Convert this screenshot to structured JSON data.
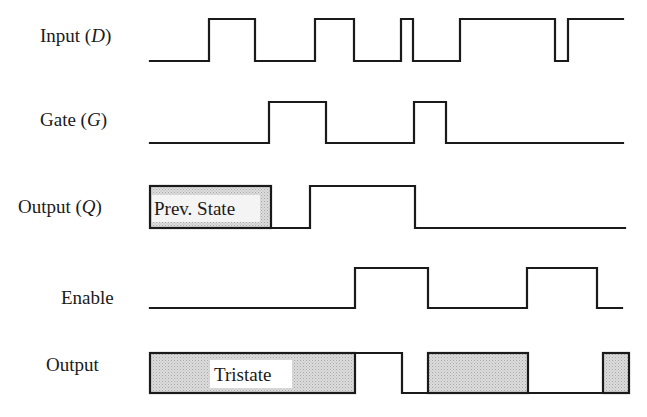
{
  "diagram": {
    "type": "timing-diagram",
    "signals": [
      {
        "id": "input_d",
        "label": "Input (",
        "label_var": "D",
        "label_end": ")",
        "y_high": 19,
        "y_low": 61,
        "points": "150,61 209,61 209,19 255,19 255,61 315,61 315,19 354,19 354,61 401,61 401,19 413,19 413,61 460,61 460,19 555,19 555,61 568,61 568,19 623,19"
      },
      {
        "id": "gate_g",
        "label": "Gate (",
        "label_var": "G",
        "label_end": ")",
        "y_high": 102,
        "y_low": 143,
        "points": "150,143 269,143 269,102 326,102 326,143 414,143 414,102 446,102 446,143 623,143"
      },
      {
        "id": "output_q",
        "label": "Output (",
        "label_var": "Q",
        "label_end": ")",
        "y_high": 186,
        "y_low": 228,
        "box": {
          "x": 150,
          "y": 186,
          "w": 121,
          "h": 42,
          "text": "Prev. State"
        },
        "points": "271,228 310,228 310,186 415,186 415,228 625,228"
      },
      {
        "id": "enable",
        "label": "Enable",
        "y_high": 268,
        "y_low": 308,
        "points": "150,308 355,308 355,268 428,268 428,308 527,308 527,268 597,268 597,308 622,308"
      },
      {
        "id": "output",
        "label": "Output",
        "y_high": 353,
        "y_low": 393,
        "boxes": [
          {
            "x": 150,
            "y": 353,
            "w": 205,
            "h": 40,
            "text": "Tristate"
          },
          {
            "x": 428,
            "y": 353,
            "w": 100,
            "h": 40,
            "text": ""
          },
          {
            "x": 603,
            "y": 353,
            "w": 26,
            "h": 40,
            "text": ""
          }
        ],
        "points": "355,353 402,353 402,393 428,393 428,393 528,393 528,393 603,393"
      }
    ],
    "labels": {
      "input_d": "Input",
      "gate_g": "Gate",
      "output_q": "Output",
      "enable": "Enable",
      "output": "Output",
      "prev_state": "Prev. State",
      "tristate": "Tristate"
    },
    "colors": {
      "stroke": "#1a1a1a",
      "hatch_fill": "#d4d4d4",
      "background": "#ffffff"
    }
  }
}
